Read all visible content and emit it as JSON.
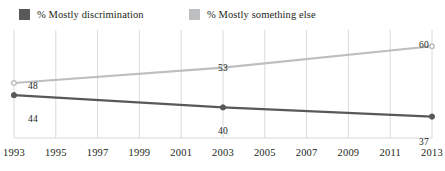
{
  "legend": {
    "items": [
      {
        "label": "% Mostly discrimination",
        "color": "#59595b",
        "icon": "legend-swatch-icon"
      },
      {
        "label": "% Mostly something else",
        "color": "#bcbec0",
        "icon": "legend-swatch-icon"
      }
    ]
  },
  "chart_data": {
    "type": "line",
    "title": "",
    "subtitle": "",
    "xlabel": "",
    "ylabel": "",
    "x": [
      1993,
      2003,
      2013
    ],
    "categories": [
      "1993",
      "1995",
      "1997",
      "1999",
      "2001",
      "2003",
      "2005",
      "2007",
      "2009",
      "2011",
      "2013"
    ],
    "tick_labels": [
      "1993",
      "1995",
      "1997",
      "1999",
      "2001",
      "2003",
      "2005",
      "2007",
      "2009",
      "2011",
      "2013"
    ],
    "xlim": [
      1993,
      2013
    ],
    "ylim": [
      30,
      64
    ],
    "grid": "vertical",
    "legend_position": "top-left",
    "series": [
      {
        "name": "% Mostly discrimination",
        "color": "#59595b",
        "x": [
          1993,
          2003,
          2013
        ],
        "values": [
          44,
          40,
          37
        ],
        "point_labels": [
          "44",
          "40",
          "37"
        ]
      },
      {
        "name": "% Mostly something else",
        "color": "#bcbec0",
        "x": [
          1993,
          2003,
          2013
        ],
        "values": [
          48,
          53,
          60
        ],
        "point_labels": [
          "48",
          "53",
          "60"
        ]
      }
    ],
    "annotations": [
      {
        "text": "48",
        "series": "% Mostly something else",
        "x": 1993,
        "value": 48
      },
      {
        "text": "44",
        "series": "% Mostly discrimination",
        "x": 1993,
        "value": 44
      },
      {
        "text": "53",
        "series": "% Mostly something else",
        "x": 2003,
        "value": 53
      },
      {
        "text": "40",
        "series": "% Mostly discrimination",
        "x": 2003,
        "value": 40
      },
      {
        "text": "60",
        "series": "% Mostly something else",
        "x": 2013,
        "value": 60
      },
      {
        "text": "37",
        "series": "% Mostly discrimination",
        "x": 2013,
        "value": 37
      }
    ]
  },
  "axis": {
    "gridline_color": "#d9dadb",
    "baseline_color": "#d9dadb"
  },
  "point_labels": {
    "p48": "48",
    "p44": "44",
    "p53": "53",
    "p40": "40",
    "p60": "60",
    "p37": "37"
  }
}
